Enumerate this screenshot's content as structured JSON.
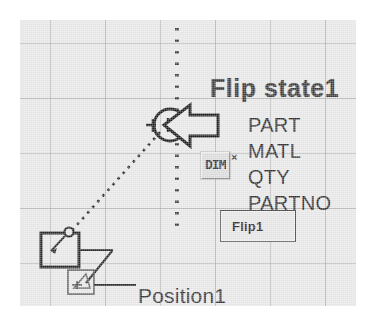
{
  "diagram": {
    "title": "Flip state1",
    "attributes": [
      "PART",
      "MATL",
      "QTY",
      "PARTNO"
    ],
    "flip_button_label": "Flip1",
    "position_label": "Position1",
    "icon_button_glyph": "DIM",
    "close_marker": "×",
    "colors": {
      "canvas_background": "#e8e8e8",
      "grid_line": "#969696",
      "ink": "#2b2b2b",
      "title_ink": "#3a3a3a",
      "button_face": "#dcdcdc"
    },
    "icons": {
      "cursor": "left-arrow-pointer-icon",
      "node": "circle-node-icon",
      "anchor": "anchor-square-icon",
      "position_marker": "position-marker-icon"
    },
    "connectors": {
      "dotted_vertical": "flip-axis-dotted-line",
      "dotted_diagonal": "anchor-to-cursor-dotted-line",
      "leader": "position-leader-line"
    }
  }
}
